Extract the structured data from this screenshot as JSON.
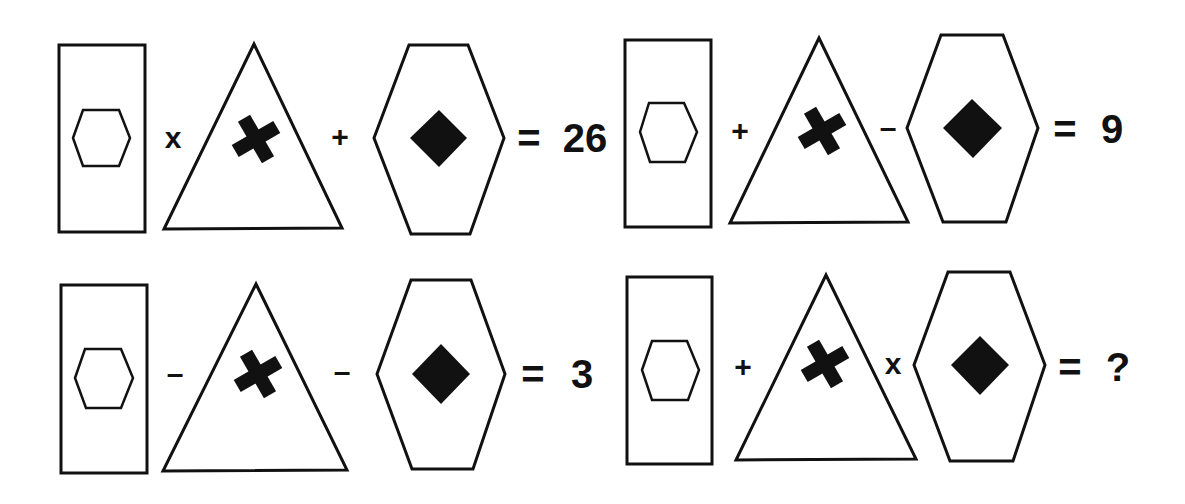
{
  "puzzle": {
    "description": "Shape math puzzle: rectangle with hexagon, triangle with cross, hexagon with diamond",
    "symbols": {
      "rectangle": {
        "name": "rectangle-with-hexagon",
        "icon": "hexagon-outline-icon"
      },
      "triangle": {
        "name": "triangle-with-cross",
        "icon": "cross-icon"
      },
      "hexagon": {
        "name": "hexagon-with-diamond",
        "icon": "diamond-icon"
      }
    },
    "colors": {
      "stroke": "#111111",
      "background": "#ffffff"
    },
    "equations": [
      {
        "op1": "x",
        "op2": "+",
        "equals": "=",
        "result": "26"
      },
      {
        "op1": "+",
        "op2": "–",
        "equals": "=",
        "result": "9"
      },
      {
        "op1": "–",
        "op2": "–",
        "equals": "=",
        "result": "3"
      },
      {
        "op1": "+",
        "op2": "x",
        "equals": "=",
        "result": "?"
      }
    ]
  }
}
